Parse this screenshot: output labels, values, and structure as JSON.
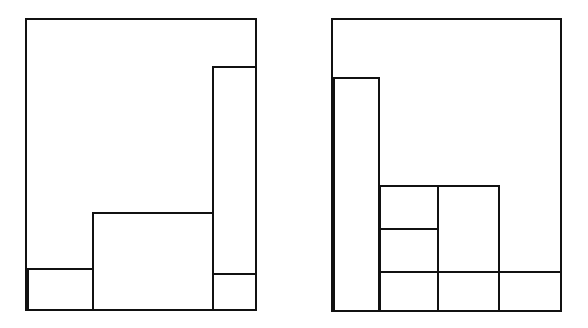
{
  "diagram": {
    "stroke_color": "#111111",
    "background": "#ffffff",
    "panels": [
      {
        "id": "left",
        "container": {
          "x": 26,
          "y": 19,
          "w": 230,
          "h": 291
        },
        "blocks": [
          {
            "name": "bottom-left-block",
            "x": 28,
            "y": 269,
            "w": 65,
            "h": 41
          },
          {
            "name": "middle-block",
            "x": 93,
            "y": 213,
            "w": 120,
            "h": 97
          },
          {
            "name": "tall-right-block",
            "x": 213,
            "y": 67,
            "w": 43,
            "h": 207
          },
          {
            "name": "bottom-right-block",
            "x": 213,
            "y": 274,
            "w": 43,
            "h": 36
          }
        ]
      },
      {
        "id": "right",
        "container": {
          "x": 332,
          "y": 19,
          "w": 229,
          "h": 292
        },
        "blocks": [
          {
            "name": "tall-left-block",
            "x": 334,
            "y": 78,
            "w": 45,
            "h": 233
          },
          {
            "name": "stack-cell-top",
            "x": 380,
            "y": 186,
            "w": 58,
            "h": 43
          },
          {
            "name": "stack-cell-middle",
            "x": 380,
            "y": 229,
            "w": 58,
            "h": 43
          },
          {
            "name": "tall-middle-block",
            "x": 438,
            "y": 186,
            "w": 61,
            "h": 86
          },
          {
            "name": "bottom-cell-1",
            "x": 380,
            "y": 272,
            "w": 58,
            "h": 39
          },
          {
            "name": "bottom-cell-2",
            "x": 438,
            "y": 272,
            "w": 61,
            "h": 39
          },
          {
            "name": "bottom-cell-3",
            "x": 499,
            "y": 272,
            "w": 62,
            "h": 39
          }
        ]
      }
    ]
  }
}
